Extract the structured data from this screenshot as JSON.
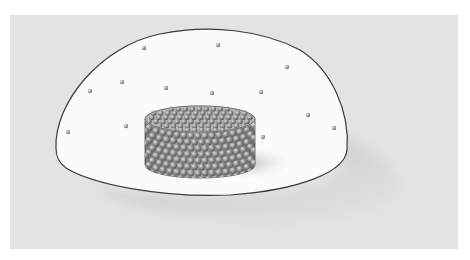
{
  "figure": {
    "width": 470,
    "height": 260,
    "colors": {
      "page": "#ffffff",
      "panel": "#e3e3e3",
      "dome_fill": "#fbfbf9",
      "dome_stroke": "#3a3a3a",
      "dot": "#9a9a9a",
      "dot_highlight": "#dcdcdc",
      "container_side": "#8e8e8e",
      "container_top": "#b4b4b4",
      "sphere": "#7e7e7e",
      "sphere_highlight": "#d8d8d8",
      "shadow": "#bdbdbd"
    },
    "panel": {
      "x": 10,
      "y": 15,
      "w": 448,
      "h": 234
    },
    "dome": {
      "path": "M 56 148 C 54 104, 100 46, 160 34 C 210 24, 262 30, 300 50 C 332 70, 350 112, 347 150 C 345 172, 300 190, 230 195 C 160 198, 92 184, 66 168 C 58 162, 56 156, 56 148 Z"
    },
    "dome_shadow": {
      "path": "M 330 135 C 360 140, 395 160, 400 185 C 400 210, 330 225, 250 220 C 180 216, 120 205, 96 188 C 150 200, 250 200, 320 185 C 345 175, 350 160, 330 135 Z"
    },
    "container": {
      "cx": 200,
      "top_cy": 119,
      "rx": 55,
      "ry": 13,
      "height": 46,
      "shadow": {
        "cx": 245,
        "cy": 163,
        "rx": 45,
        "ry": 14
      }
    },
    "dots": [
      {
        "x": 144,
        "y": 48
      },
      {
        "x": 218,
        "y": 45
      },
      {
        "x": 287,
        "y": 67
      },
      {
        "x": 122,
        "y": 82
      },
      {
        "x": 90,
        "y": 91
      },
      {
        "x": 166,
        "y": 88
      },
      {
        "x": 212,
        "y": 93
      },
      {
        "x": 261,
        "y": 92
      },
      {
        "x": 308,
        "y": 115
      },
      {
        "x": 334,
        "y": 128
      },
      {
        "x": 263,
        "y": 137
      },
      {
        "x": 126,
        "y": 126
      },
      {
        "x": 68,
        "y": 132
      }
    ]
  }
}
